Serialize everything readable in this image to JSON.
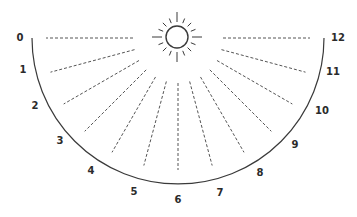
{
  "diagram": {
    "type": "sundial-hour-lines",
    "colors": {
      "line": "#3a3a3a",
      "dash": "#555555",
      "text": "#2b2b2b",
      "background": "#ffffff"
    },
    "center": [
      178,
      38
    ],
    "arc_radius": 146,
    "dash_inner_radius": 45,
    "dash_outer_radius": 132,
    "sun": {
      "cx": 177,
      "cy": 37,
      "r": 11,
      "ray_count": 16
    },
    "hours": [
      {
        "label": "0",
        "x": 20,
        "y": 38
      },
      {
        "label": "1",
        "x": 23,
        "y": 70
      },
      {
        "label": "2",
        "x": 35,
        "y": 106
      },
      {
        "label": "3",
        "x": 60,
        "y": 141
      },
      {
        "label": "4",
        "x": 91,
        "y": 171
      },
      {
        "label": "5",
        "x": 134,
        "y": 192
      },
      {
        "label": "6",
        "x": 178,
        "y": 200
      },
      {
        "label": "7",
        "x": 220,
        "y": 193
      },
      {
        "label": "8",
        "x": 260,
        "y": 173
      },
      {
        "label": "9",
        "x": 295,
        "y": 145
      },
      {
        "label": "10",
        "x": 322,
        "y": 111
      },
      {
        "label": "11",
        "x": 333,
        "y": 72
      },
      {
        "label": "12",
        "x": 338,
        "y": 38
      }
    ]
  }
}
